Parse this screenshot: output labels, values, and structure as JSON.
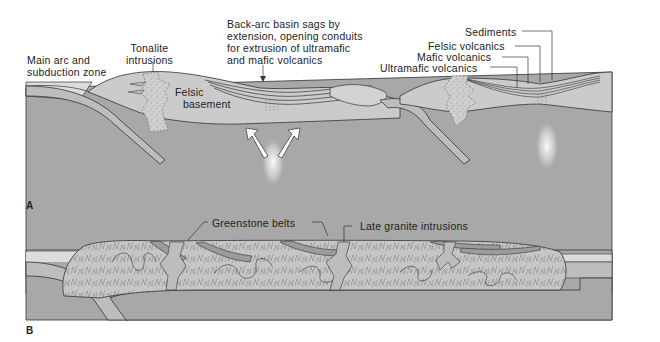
{
  "panels": [
    {
      "id": "A",
      "letter": "A",
      "labels": {
        "main_arc": [
          "Main arc and",
          "subduction zone"
        ],
        "tonalite": [
          "Tonalite",
          "intrusions"
        ],
        "felsic_basement": [
          "Felsic",
          "basement"
        ],
        "back_arc": [
          "Back-arc basin sags by",
          "extension, opening conduits",
          "for extrusion of ultramafic",
          "and mafic volcanics"
        ],
        "sediments": "Sediments",
        "felsic_volcanics": "Felsic volcanics",
        "mafic_volcanics": "Mafic volcanics",
        "ultramafic_volcanics": "Ultramafic volcanics"
      }
    },
    {
      "id": "B",
      "letter": "B",
      "labels": {
        "greenstone_belts": "Greenstone belts",
        "late_granite": "Late granite intrusions"
      }
    }
  ],
  "colors": {
    "mantle": "#a8a8a8",
    "crust": "#c9c9c9",
    "light_crust": "#dcdcdc",
    "sediment_top": "#e4e4e4",
    "arrow": "#6e6e6e",
    "line": "#333333",
    "greenstone": "#9c9c9c",
    "granite": "#bdbdbd"
  }
}
